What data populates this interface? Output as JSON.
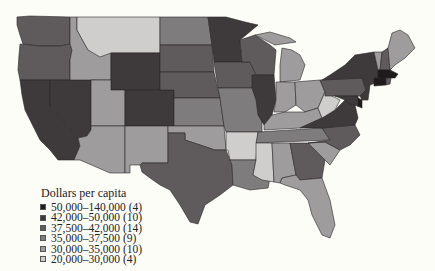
{
  "legend": {
    "title": "Dollars per capita",
    "items": [
      {
        "label": "50,000–140,000 (4)",
        "color": "#1f1a1c"
      },
      {
        "label": "42,000–50,000 (10)",
        "color": "#3e393b"
      },
      {
        "label": "37,500–42,000 (14)",
        "color": "#5f5b5d"
      },
      {
        "label": "35,000–37,500 (9)",
        "color": "#7f7c7d"
      },
      {
        "label": "30,000–35,000 (10)",
        "color": "#9e9c9d"
      },
      {
        "label": "20,000–30,000 (4)",
        "color": "#cfcecd"
      }
    ]
  },
  "map": {
    "subject": "United States by state",
    "states": [
      {
        "id": "WA",
        "class": 2
      },
      {
        "id": "OR",
        "class": 2
      },
      {
        "id": "CA",
        "class": 1
      },
      {
        "id": "NV",
        "class": 1
      },
      {
        "id": "ID",
        "class": 4
      },
      {
        "id": "MT",
        "class": 5
      },
      {
        "id": "WY",
        "class": 1
      },
      {
        "id": "UT",
        "class": 4
      },
      {
        "id": "CO",
        "class": 1
      },
      {
        "id": "AZ",
        "class": 4
      },
      {
        "id": "NM",
        "class": 4
      },
      {
        "id": "ND",
        "class": 3
      },
      {
        "id": "SD",
        "class": 2
      },
      {
        "id": "NE",
        "class": 2
      },
      {
        "id": "KS",
        "class": 3
      },
      {
        "id": "OK",
        "class": 4
      },
      {
        "id": "TX",
        "class": 2
      },
      {
        "id": "MN",
        "class": 1
      },
      {
        "id": "IA",
        "class": 2
      },
      {
        "id": "MO",
        "class": 3
      },
      {
        "id": "AR",
        "class": 5
      },
      {
        "id": "LA",
        "class": 3
      },
      {
        "id": "WI",
        "class": 2
      },
      {
        "id": "IL",
        "class": 1
      },
      {
        "id": "MI",
        "class": 4
      },
      {
        "id": "IN",
        "class": 4
      },
      {
        "id": "OH",
        "class": 4
      },
      {
        "id": "KY",
        "class": 4
      },
      {
        "id": "TN",
        "class": 3
      },
      {
        "id": "MS",
        "class": 5
      },
      {
        "id": "AL",
        "class": 4
      },
      {
        "id": "GA",
        "class": 2
      },
      {
        "id": "FL",
        "class": 4
      },
      {
        "id": "SC",
        "class": 4
      },
      {
        "id": "NC",
        "class": 2
      },
      {
        "id": "VA",
        "class": 1
      },
      {
        "id": "WV",
        "class": 5
      },
      {
        "id": "PA",
        "class": 2
      },
      {
        "id": "NY",
        "class": 1
      },
      {
        "id": "VT",
        "class": 4
      },
      {
        "id": "NH",
        "class": 2
      },
      {
        "id": "ME",
        "class": 4
      },
      {
        "id": "MA",
        "class": 0
      },
      {
        "id": "CT",
        "class": 0
      },
      {
        "id": "NJ",
        "class": 1
      },
      {
        "id": "DE",
        "class": 0
      },
      {
        "id": "MD",
        "class": 1
      },
      {
        "id": "RI",
        "class": 2
      }
    ]
  }
}
